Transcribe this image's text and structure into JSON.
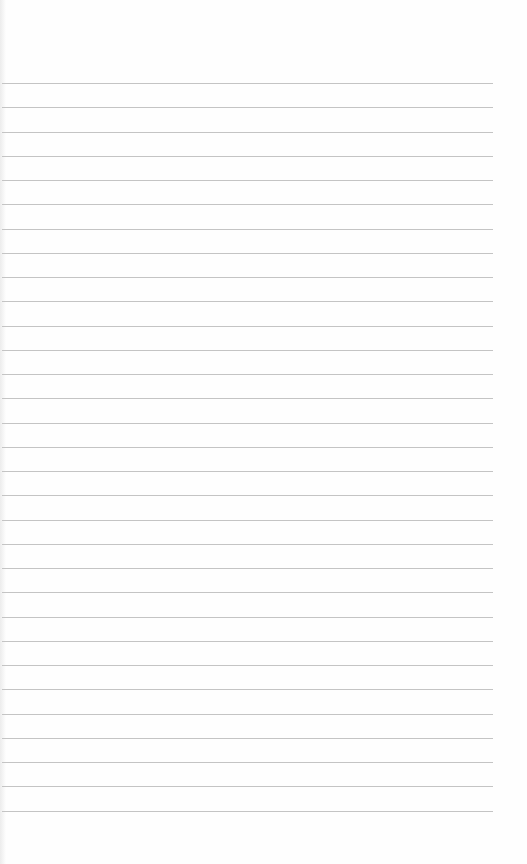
{
  "page": {
    "type": "blank lined notebook paper",
    "background_color": "#fefefe",
    "line_color": "#c4c4c4",
    "line_count": 31,
    "first_line_y": 83,
    "line_spacing": 24.25,
    "line_left": 2,
    "line_right": 493
  }
}
